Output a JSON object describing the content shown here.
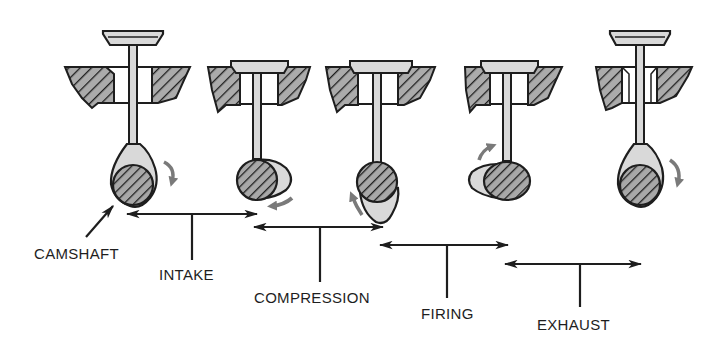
{
  "diagram": {
    "colors": {
      "ink": "#1e1e1e",
      "shade": "#a8a8a8",
      "light_fill": "#d9d9d9",
      "rotation_arrow": "#7a7a7a",
      "background": "#ffffff"
    },
    "labels": {
      "camshaft": "CAMSHAFT",
      "intake": "INTAKE",
      "compression": "COMPRESSION",
      "firing": "FIRING",
      "exhaust": "EXHAUST"
    },
    "valves": [
      {
        "position": 1,
        "state": "open",
        "cam_lobe": "up",
        "rotation_arrow": "clockwise-down-right"
      },
      {
        "position": 2,
        "state": "closed",
        "cam_lobe": "right",
        "rotation_arrow": "down-left"
      },
      {
        "position": 3,
        "state": "closed",
        "cam_lobe": "down",
        "rotation_arrow": "up-left"
      },
      {
        "position": 4,
        "state": "closed",
        "cam_lobe": "left",
        "rotation_arrow": "up-right"
      },
      {
        "position": 5,
        "state": "open",
        "cam_lobe": "up",
        "rotation_arrow": "clockwise-down-right"
      }
    ],
    "strokes": [
      {
        "name": "INTAKE",
        "from_x": 127,
        "to_x": 257,
        "y": 214
      },
      {
        "name": "COMPRESSION",
        "from_x": 254,
        "to_x": 383,
        "y": 227
      },
      {
        "name": "FIRING",
        "from_x": 380,
        "to_x": 508,
        "y": 245
      },
      {
        "name": "EXHAUST",
        "from_x": 505,
        "to_x": 641,
        "y": 264
      }
    ]
  }
}
